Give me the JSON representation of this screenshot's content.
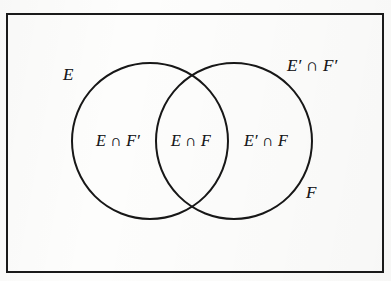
{
  "figure": {
    "type": "venn-diagram-two-set",
    "colors": {
      "stroke": "#1a1a1a",
      "background": "#fdfdfc",
      "text": "#17171a"
    },
    "universe_rect": {
      "name": "universal-set-rectangle",
      "x": 7,
      "y": 14,
      "width": 376,
      "height": 258,
      "stroke_width": 2
    },
    "circles": [
      {
        "name": "set-e-circle",
        "label": "E",
        "cx": 150,
        "cy": 141,
        "r": 78,
        "stroke_width": 2
      },
      {
        "name": "set-f-circle",
        "label": "F",
        "cx": 234,
        "cy": 141,
        "r": 78,
        "stroke_width": 2
      }
    ],
    "set_labels": [
      {
        "id": "set-e",
        "text": "E",
        "position": "upper-left-outside-circle"
      },
      {
        "id": "set-f",
        "text": "F",
        "position": "lower-right-outside-circle"
      }
    ],
    "region_labels": [
      {
        "id": "region-e-only",
        "text": "E ∩ F′",
        "position": "left-lune"
      },
      {
        "id": "region-intersection",
        "text": "E ∩ F",
        "position": "center-lens"
      },
      {
        "id": "region-f-only",
        "text": "E′ ∩ F",
        "position": "right-lune"
      },
      {
        "id": "region-neither",
        "text": "E′ ∩ F′",
        "position": "outside-both-upper-right"
      }
    ]
  }
}
